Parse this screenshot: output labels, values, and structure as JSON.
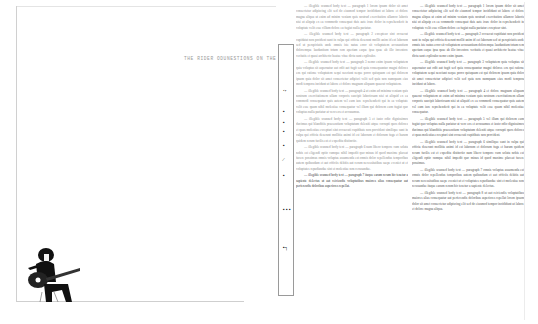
{
  "document": {
    "type": "scanned magazine spread",
    "title_line": "THE RIDER ODUNESTIONS ON THE ROCK",
    "sidebar_glyphs": [
      "‘’",
      "▪",
      "▪",
      "▪",
      "▪",
      "⁄",
      "▪",
      "▪ ▪ ▪",
      "▪┐"
    ],
    "photo": {
      "description": "black-and-white photo of a long-haired guitarist seated on a stool playing an electric guitar",
      "icon": "guitarist-photo"
    },
    "middle_column": {
      "paragraphs": [
        "— illegible scanned body text — paragraph 1",
        "— illegible scanned body text — paragraph 2",
        "— illegible scanned body text — paragraph 3",
        "— illegible scanned body text — paragraph 4",
        "— illegible scanned body text — paragraph 5",
        "— illegible scanned body text — paragraph 6",
        "— illegible scanned body text — paragraph 7"
      ]
    },
    "right_column": {
      "paragraphs": [
        "— illegible scanned body text — paragraph 1",
        "— illegible scanned body text — paragraph 2",
        "— illegible scanned body text — paragraph 3",
        "— illegible scanned body text — paragraph 4",
        "— illegible scanned body text — paragraph 5",
        "— illegible scanned body text — paragraph 6",
        "— illegible scanned body text — paragraph 7",
        "— illegible scanned body text — paragraph 8"
      ]
    }
  }
}
